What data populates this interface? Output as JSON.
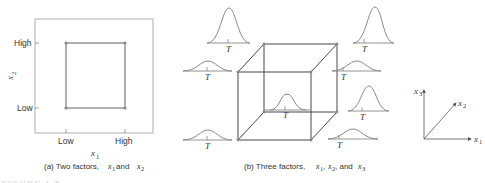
{
  "panel_a": {
    "y_axis_label": "x",
    "y_axis_sub": "2",
    "x_axis_label": "x",
    "x_axis_sub": "1",
    "y_ticks": [
      "High",
      "Low"
    ],
    "x_ticks": [
      "Low",
      "High"
    ],
    "caption_prefix": "(a) Two factors, ",
    "caption_v1": "x",
    "caption_v1_sub": "1",
    "caption_and": " and ",
    "caption_v2": "x",
    "caption_v2_sub": "2"
  },
  "panel_b": {
    "dist_label": "T",
    "caption_prefix": "(b) Three factors, ",
    "caption_v1": "x",
    "caption_v1_sub": "1",
    "caption_sep1": ", ",
    "caption_v2": "x",
    "caption_v2_sub": "2",
    "caption_sep2": ", and ",
    "caption_v3": "x",
    "caption_v3_sub": "3"
  },
  "axes_3d": {
    "x1": "x",
    "x1_sub": "1",
    "x2": "x",
    "x2_sub": "2",
    "x3": "x",
    "x3_sub": "3"
  },
  "figure_label": "FIGURE 1-5",
  "colors": {
    "line": "#333333",
    "curve": "#888888",
    "square": "#999999"
  }
}
